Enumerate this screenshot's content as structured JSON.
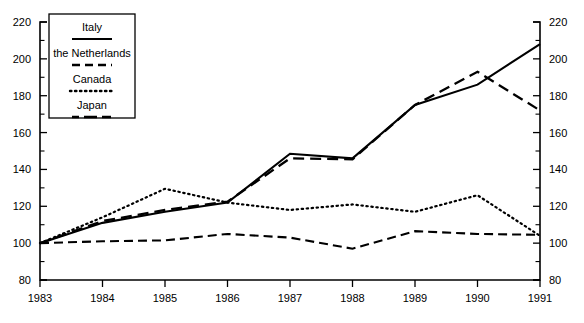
{
  "chart_data": {
    "type": "line",
    "title": "",
    "xlabel": "",
    "ylabel": "",
    "x": [
      1983,
      1984,
      1985,
      1986,
      1987,
      1988,
      1989,
      1990,
      1991
    ],
    "xtick_labels": [
      "1983",
      "1984",
      "1985",
      "1986",
      "1987",
      "1988",
      "1989",
      "1990",
      "1991"
    ],
    "ytick_labels": [
      "80",
      "100",
      "120",
      "140",
      "160",
      "180",
      "200",
      "220"
    ],
    "yticks": [
      80,
      100,
      120,
      140,
      160,
      180,
      200,
      220
    ],
    "ylim": [
      80,
      220
    ],
    "xlim": [
      1983,
      1991
    ],
    "grid": false,
    "minor_ticks": true,
    "minor_tick_step": 10,
    "dual_y_axis": true,
    "legend_position": "upper-left",
    "series": [
      {
        "name": "Italy",
        "style": "solid",
        "values": [
          100,
          111,
          117,
          122,
          148.5,
          146,
          175,
          186,
          208
        ]
      },
      {
        "name": "the Netherlands",
        "style": "dashed",
        "values": [
          100,
          112,
          118,
          122.5,
          146,
          145.5,
          175,
          193,
          172
        ]
      },
      {
        "name": "Canada",
        "style": "dotted",
        "values": [
          100,
          114,
          129.5,
          122,
          118,
          121,
          117,
          126,
          104
        ]
      },
      {
        "name": "Japan",
        "style": "dash-dot",
        "values": [
          100,
          101,
          101.5,
          105,
          103,
          97,
          106.5,
          105,
          104.5
        ]
      }
    ]
  },
  "legend": {
    "items": [
      {
        "label": "Italy",
        "style": "solid"
      },
      {
        "label": "the Netherlands",
        "style": "dashed"
      },
      {
        "label": "Canada",
        "style": "dotted"
      },
      {
        "label": "Japan",
        "style": "dash-dot"
      }
    ]
  },
  "colors": {
    "line": "#000000",
    "background": "#ffffff",
    "axis": "#000000"
  }
}
